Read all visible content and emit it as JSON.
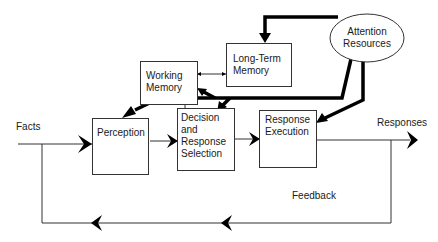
{
  "diagram": {
    "type": "information-processing-model",
    "nodes": {
      "attention": {
        "label_line1": "Attention",
        "label_line2": "Resources",
        "shape": "ellipse"
      },
      "long_term_memory": {
        "label_line1": "Long-Term",
        "label_line2": "Memory"
      },
      "working_memory": {
        "label_line1": "Working",
        "label_line2": "Memory"
      },
      "perception": {
        "label": "Perception"
      },
      "decision": {
        "label_line1": "Decision",
        "label_line2": "and",
        "label_line3": "Response",
        "label_line4": "Selection"
      },
      "response_execution": {
        "label_line1": "Response",
        "label_line2": "Execution"
      }
    },
    "labels": {
      "input": "Facts",
      "output": "Responses",
      "feedback": "Feedback"
    },
    "edges": [
      {
        "from": "Facts",
        "to": "Perception"
      },
      {
        "from": "Perception",
        "to": "Decision and Response Selection"
      },
      {
        "from": "Decision and Response Selection",
        "to": "Response Execution"
      },
      {
        "from": "Response Execution",
        "to": "Responses"
      },
      {
        "from": "Working Memory",
        "to": "Long-Term Memory",
        "bidirectional": true
      },
      {
        "from": "Working Memory",
        "to": "Decision and Response Selection"
      },
      {
        "from": "Attention Resources",
        "to": "Long-Term Memory",
        "thick": true
      },
      {
        "from": "Attention Resources",
        "to": "Working Memory",
        "thick": true
      },
      {
        "from": "Attention Resources",
        "to": "Perception",
        "thick": true
      },
      {
        "from": "Attention Resources",
        "to": "Decision and Response Selection",
        "thick": true
      },
      {
        "from": "Attention Resources",
        "to": "Response Execution",
        "thick": true
      },
      {
        "from": "Responses",
        "to": "Facts",
        "label": "Feedback"
      }
    ],
    "colors": {
      "line": "#000000",
      "box_border": "#333333",
      "background": "#ffffff"
    }
  }
}
